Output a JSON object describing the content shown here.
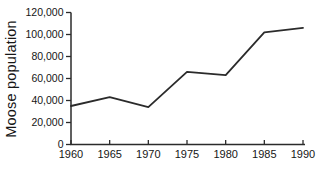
{
  "page": {
    "background_color": "#ffffff",
    "text_color": "#161616"
  },
  "chart_data": {
    "type": "line",
    "title": "",
    "xlabel": "",
    "ylabel": "Moose population",
    "categories": [
      1960,
      1965,
      1970,
      1975,
      1980,
      1985,
      1990
    ],
    "series": [
      {
        "name": "Moose population",
        "values": [
          35000,
          43000,
          34000,
          66000,
          63000,
          102000,
          106000
        ]
      }
    ],
    "ylim": [
      0,
      120000
    ],
    "ytick_step": 20000,
    "ytick_labels": [
      "0",
      "20,000",
      "40,000",
      "60,000",
      "80,000",
      "100,000",
      "120,000"
    ],
    "grid": false,
    "legend_position": "none",
    "markers": false,
    "line_color": "#2b2b2b",
    "axis_color": "#2b2b2b",
    "label_color": "#161616"
  }
}
